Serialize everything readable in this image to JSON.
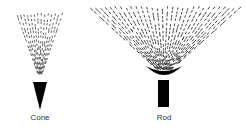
{
  "diagram": {
    "items": [
      {
        "label": "Cone",
        "shape": "cone-emitter"
      },
      {
        "label": "Rod",
        "shape": "rod-emitter"
      }
    ],
    "colors": {
      "ink": "#000000",
      "spray": "#444444",
      "background": "#ffffff"
    }
  }
}
